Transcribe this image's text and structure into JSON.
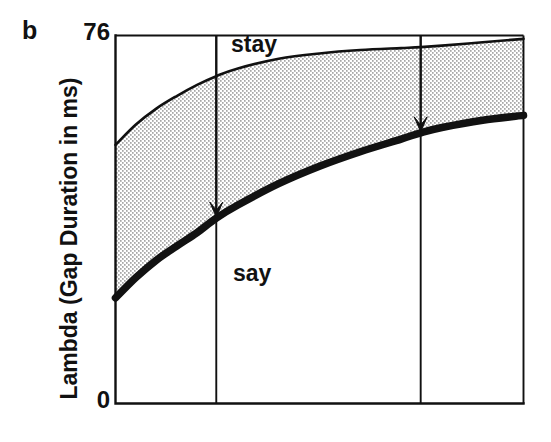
{
  "figure": {
    "panel_label": "b",
    "y_axis_title": "Lambda (Gap Duration in ms)",
    "y_tick_top": "76",
    "y_tick_bottom": "0",
    "region_label_upper": "stay",
    "region_label_lower": "say",
    "ink_color": "#111111",
    "fill_color": "#ffffff",
    "stipple_color": "#2a2a2a"
  },
  "chart_data": {
    "type": "area",
    "title": "",
    "subtitle": "",
    "xlabel": "",
    "ylabel": "Lambda (Gap Duration in ms)",
    "ylim": [
      0,
      76
    ],
    "y_ticks": [
      0,
      76
    ],
    "y_tick_labels": [
      "0",
      "76"
    ],
    "xlim": [
      0,
      100
    ],
    "x_ticks": [
      0,
      24.7,
      74.8,
      100
    ],
    "x_tick_labels": [
      "",
      "",
      "",
      ""
    ],
    "grid": false,
    "legend": null,
    "annotations": [
      {
        "text": "stay",
        "x": 24.7,
        "y": 73.0,
        "note": "region above upper boundary curve"
      },
      {
        "text": "say",
        "x": 29.0,
        "y": 24.5,
        "note": "region below lower boundary curve"
      },
      {
        "text": "arrow",
        "x": 24.7,
        "y_from": 76.0,
        "y_to": 38.3,
        "note": "vertical down-arrow from top axis to lower thick curve at first vertical line"
      },
      {
        "text": "arrow",
        "x": 74.8,
        "y_from": 76.0,
        "y_to": 55.9,
        "note": "vertical down-arrow from top axis to lower thick curve at second vertical line"
      }
    ],
    "x": [
      0,
      5,
      10,
      15,
      20,
      24.7,
      30,
      40,
      50,
      60,
      70,
      74.8,
      80,
      90,
      100
    ],
    "series": [
      {
        "name": "upper boundary (ambiguous/stay threshold)",
        "style": "thin-line",
        "values": [
          53.4,
          57.6,
          60.9,
          63.5,
          65.8,
          67.6,
          69.2,
          71.2,
          72.3,
          73.0,
          73.4,
          73.6,
          73.9,
          74.6,
          75.3
        ]
      },
      {
        "name": "lower boundary (say threshold)",
        "style": "thick-line",
        "values": [
          21.8,
          26.0,
          29.6,
          32.5,
          35.3,
          38.3,
          41.0,
          45.4,
          49.0,
          52.0,
          54.6,
          55.9,
          57.0,
          58.5,
          59.5
        ]
      }
    ],
    "shaded_band": {
      "between": [
        "lower boundary (say threshold)",
        "upper boundary (ambiguous/stay threshold)"
      ],
      "pattern": "stipple-dots",
      "label": "ambiguous region"
    }
  }
}
